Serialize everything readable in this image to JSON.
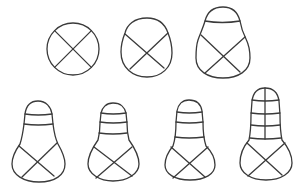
{
  "diagram": {
    "type": "developmental-stages-line-drawing",
    "stroke_color": "#3a3a3a",
    "background": "#ffffff",
    "rows": [
      {
        "stages": [
          {
            "id": "stage-1",
            "shape": "circle",
            "lower_cross_division": true,
            "transverse_bands": 0,
            "longitudinal_divisions": 0
          },
          {
            "id": "stage-2",
            "shape": "pear-rounded",
            "lower_cross_division": true,
            "transverse_bands": 0,
            "longitudinal_divisions": 0
          },
          {
            "id": "stage-3",
            "shape": "pear-with-cap",
            "lower_cross_division": true,
            "transverse_bands": 1,
            "longitudinal_divisions": 0
          }
        ]
      },
      {
        "stages": [
          {
            "id": "stage-4",
            "shape": "bulb-with-neck",
            "lower_cross_division": true,
            "transverse_bands": 2,
            "longitudinal_divisions": 0
          },
          {
            "id": "stage-5",
            "shape": "bulb-with-neck",
            "lower_cross_division": true,
            "transverse_bands": 3,
            "longitudinal_divisions": 0
          },
          {
            "id": "stage-6",
            "shape": "bulb-with-long-neck",
            "lower_cross_division": true,
            "transverse_bands": 3,
            "longitudinal_divisions": 0
          },
          {
            "id": "stage-7",
            "shape": "bulb-with-long-neck",
            "lower_cross_division": true,
            "transverse_bands": 4,
            "longitudinal_divisions": 1
          }
        ]
      }
    ],
    "text_labels": []
  }
}
